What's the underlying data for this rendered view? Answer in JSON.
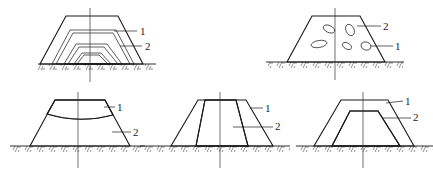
{
  "diagram": {
    "figures": [
      {
        "id": "fig-a",
        "description": "Layered embankment with alternating hatched zones",
        "labels": [
          {
            "text": "1",
            "x": 140,
            "y": 35
          },
          {
            "text": "2",
            "x": 145,
            "y": 50
          }
        ]
      },
      {
        "id": "fig-b",
        "description": "Hatched embankment with embedded inclusions (stones)",
        "labels": [
          {
            "text": "2",
            "x": 383,
            "y": 30
          },
          {
            "text": "1",
            "x": 395,
            "y": 50
          }
        ]
      },
      {
        "id": "fig-c",
        "description": "Stippled upper cap over hatched body",
        "labels": [
          {
            "text": "1",
            "x": 117,
            "y": 111
          },
          {
            "text": "2",
            "x": 133,
            "y": 136
          }
        ]
      },
      {
        "id": "fig-d",
        "description": "Hatched central core with stippled outer shells",
        "labels": [
          {
            "text": "1",
            "x": 265,
            "y": 112
          },
          {
            "text": "2",
            "x": 275,
            "y": 130
          }
        ]
      },
      {
        "id": "fig-e",
        "description": "Stippled core wrapped in hatched outer shell",
        "labels": [
          {
            "text": "1",
            "x": 405,
            "y": 105
          },
          {
            "text": "2",
            "x": 413,
            "y": 121
          }
        ]
      }
    ],
    "colors": {
      "line": "#1a1a1a",
      "background": "#ffffff"
    }
  }
}
